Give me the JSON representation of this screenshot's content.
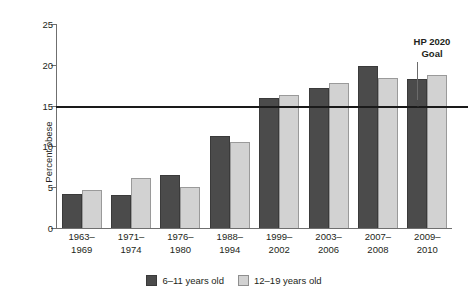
{
  "chart_data": {
    "type": "bar",
    "title": "",
    "xlabel": "",
    "ylabel": "Percent obese",
    "ylim": [
      0,
      25
    ],
    "yticks": [
      0,
      5,
      10,
      15,
      20,
      25
    ],
    "ytick_labels": [
      "0",
      "5",
      "10",
      "15",
      "20",
      "25"
    ],
    "grid": false,
    "legend_position": "bottom-center",
    "categories": [
      "1963–1969",
      "1971–1974",
      "1976–1980",
      "1988–1994",
      "1999–2002",
      "2003–2006",
      "2007–2008",
      "2009–2010"
    ],
    "category_lines": [
      [
        "1963–",
        "1969"
      ],
      [
        "1971–",
        "1974"
      ],
      [
        "1976–",
        "1980"
      ],
      [
        "1988–",
        "1994"
      ],
      [
        "1999–",
        "2002"
      ],
      [
        "2003–",
        "2006"
      ],
      [
        "2007–",
        "2008"
      ],
      [
        "2009–",
        "2010"
      ]
    ],
    "series": [
      {
        "name": "6–11 years old",
        "color": "#4b4b4b",
        "values": [
          4.2,
          4.0,
          6.5,
          11.3,
          15.9,
          17.2,
          19.9,
          18.3
        ]
      },
      {
        "name": "12–19 years old",
        "color": "#d2d2d2",
        "values": [
          4.6,
          6.1,
          5.0,
          10.5,
          16.3,
          17.8,
          18.4,
          18.7
        ]
      }
    ],
    "annotations": [
      {
        "name": "hp-2020-goal",
        "text_lines": [
          "HP 2020",
          "Goal"
        ],
        "value": 14.8,
        "type": "horizontal-reference-line-with-arrow",
        "color": "#1a1a1a"
      }
    ]
  },
  "legend": {
    "items": [
      {
        "label": "6–11 years old",
        "swatch": "dark-gray-swatch"
      },
      {
        "label": "12–19 years old",
        "swatch": "light-gray-swatch"
      }
    ]
  }
}
